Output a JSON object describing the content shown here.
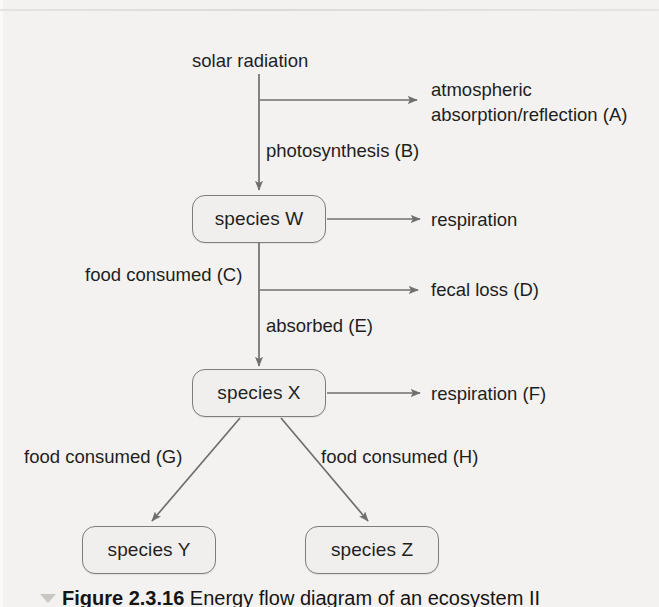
{
  "figure": {
    "caption_number": "Figure 2.3.16",
    "caption_text": "Energy flow diagram of an ecosystem II",
    "marker_icon": "triangle-marker-icon"
  },
  "diagram": {
    "type": "flow-diagram",
    "title": "Energy flow diagram of an ecosystem II",
    "nodes": [
      {
        "id": "W",
        "label": "species W"
      },
      {
        "id": "X",
        "label": "species X"
      },
      {
        "id": "Y",
        "label": "species Y"
      },
      {
        "id": "Z",
        "label": "species Z"
      }
    ],
    "source_label": "solar radiation",
    "edge_labels": {
      "atmospheric_line1": "atmospheric",
      "atmospheric_line2": "absorption/reflection (A)",
      "photosynthesis": "photosynthesis (B)",
      "respiration_w": "respiration",
      "food_consumed_c": "food consumed (C)",
      "fecal_loss": "fecal loss (D)",
      "absorbed": "absorbed (E)",
      "respiration_x": "respiration (F)",
      "food_consumed_g": "food consumed (G)",
      "food_consumed_h": "food consumed (H)"
    },
    "flows": [
      {
        "from": "solar radiation",
        "to": "atmospheric absorption/reflection (A)",
        "label": ""
      },
      {
        "from": "solar radiation",
        "to": "species W",
        "label": "photosynthesis (B)"
      },
      {
        "from": "species W",
        "to": "respiration",
        "label": ""
      },
      {
        "from": "species W",
        "to": "species X",
        "label": "food consumed (C) / absorbed (E)"
      },
      {
        "from": "species W",
        "to": "fecal loss (D)",
        "label": ""
      },
      {
        "from": "species X",
        "to": "respiration (F)",
        "label": ""
      },
      {
        "from": "species X",
        "to": "species Y",
        "label": "food consumed (G)"
      },
      {
        "from": "species X",
        "to": "species Z",
        "label": "food consumed (H)"
      }
    ],
    "colors": {
      "background": "#f3f2f0",
      "line": "#6f6f6f",
      "box_border": "#7d7d7d",
      "box_fill": "#f0efed",
      "text": "#1e1e1e"
    }
  }
}
